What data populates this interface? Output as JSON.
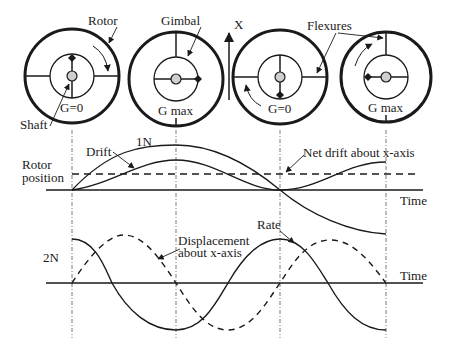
{
  "diagram": {
    "colors": {
      "ink": "#1a1a1a",
      "shaft_fill": "#cfcfcf",
      "background": "#ffffff"
    },
    "top_labels": {
      "rotor": "Rotor",
      "gimbal": "Gimbal",
      "x_axis": "X",
      "flexures": "Flexures",
      "shaft": "Shaft"
    },
    "rotor_states": [
      {
        "label": "G=0",
        "gimbal_mass_position": "top",
        "rotation_arrow": "clockwise-right"
      },
      {
        "label": "G max",
        "gimbal_mass_position": "right",
        "rotation_arrow": "none"
      },
      {
        "label": "G=0",
        "gimbal_mass_position": "bottom",
        "rotation_arrow": "counterclockwise-left"
      },
      {
        "label": "G max",
        "gimbal_mass_position": "left",
        "rotation_arrow": "clockwise-upper-left"
      }
    ],
    "graph_1N": {
      "harmonic_label": "1N",
      "left_label_line1": "Rotor",
      "left_label_line2": "position",
      "drift_label": "Drift",
      "net_drift_label": "Net drift about x-axis",
      "time_label": "Time"
    },
    "graph_2N": {
      "harmonic_label": "2N",
      "rate_label": "Rate",
      "displacement_label_line1": "Displacement",
      "displacement_label_line2": "about x-axis",
      "time_label": "Time"
    }
  }
}
